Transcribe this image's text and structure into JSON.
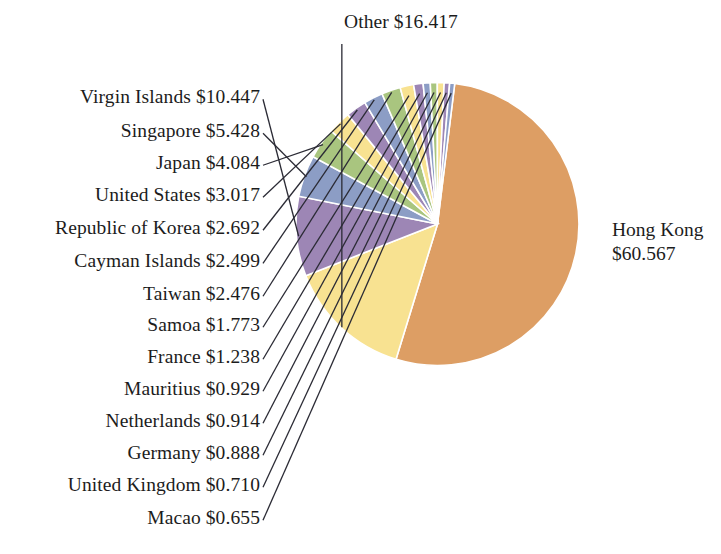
{
  "chart_data": {
    "type": "pie",
    "title": "",
    "unit": "$",
    "value_suffix": "",
    "total": 114.734,
    "legend_position": "callout-labels",
    "categories": [
      "Hong Kong",
      "Other",
      "Virgin Islands",
      "Singapore",
      "Japan",
      "United States",
      "Republic of Korea",
      "Cayman Islands",
      "Taiwan",
      "Samoa",
      "France",
      "Mauritius",
      "Netherlands",
      "Germany",
      "United Kingdom",
      "Macao"
    ],
    "values": [
      60.567,
      16.417,
      10.447,
      5.428,
      4.084,
      3.017,
      2.692,
      2.499,
      2.476,
      1.773,
      1.238,
      0.929,
      0.914,
      0.888,
      0.71,
      0.655
    ],
    "value_labels": [
      "$60.567",
      "$16.417",
      "$10.447",
      "$5.428",
      "$4.084",
      "$3.017",
      "$2.692",
      "$2.499",
      "$2.476",
      "$1.773",
      "$1.238",
      "$0.929",
      "$0.914",
      "$0.888",
      "$0.710",
      "$0.655"
    ],
    "colors": [
      "#dd9e64",
      "#f8e291",
      "#9d86b5",
      "#8c9dc5",
      "#a9c57f",
      "#f8e291",
      "#9d86b5",
      "#8c9dc5",
      "#a9c57f",
      "#f8e291",
      "#9d86b5",
      "#8c9dc5",
      "#a9c57f",
      "#f8e291",
      "#9d86b5",
      "#8c9dc5"
    ]
  },
  "labels": {
    "hong_kong_line1": "Hong Kong",
    "hong_kong_line2": "$60.567",
    "other": "Other $16.417",
    "virgin_islands": "Virgin Islands $10.447",
    "singapore": "Singapore $5.428",
    "japan": "Japan $4.084",
    "united_states": "United States $3.017",
    "republic_of_korea": "Republic of Korea $2.692",
    "cayman_islands": "Cayman Islands $2.499",
    "taiwan": "Taiwan $2.476",
    "samoa": "Samoa $1.773",
    "france": "France $1.238",
    "mauritius": "Mauritius $0.929",
    "netherlands": "Netherlands $0.914",
    "germany": "Germany $0.888",
    "united_kingdom": "United Kingdom $0.710",
    "macao": "Macao $0.655"
  },
  "style": {
    "slice_stroke": "#ffffff",
    "leader_line_color": "#2b2b35",
    "background": "#ffffff"
  }
}
